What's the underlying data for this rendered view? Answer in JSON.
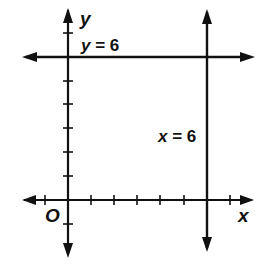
{
  "diagram": {
    "axes": {
      "x_label": "x",
      "y_label": "y",
      "origin_label": "O",
      "tick_spacing_units": 1,
      "x_ticks": [
        -1,
        1,
        2,
        3,
        4,
        5,
        7
      ],
      "y_ticks": [
        -1,
        1,
        2,
        3,
        4,
        5,
        7
      ]
    },
    "lines": [
      {
        "id": "horizontal",
        "equation": "y = 6",
        "label_var": "y",
        "label_rest": " = 6",
        "type": "horizontal",
        "value": 6
      },
      {
        "id": "vertical",
        "equation": "x = 6",
        "label_var": "x",
        "label_rest": " = 6",
        "type": "vertical",
        "value": 6
      }
    ],
    "colors": {
      "ink": "#111111",
      "background": "#ffffff"
    }
  }
}
